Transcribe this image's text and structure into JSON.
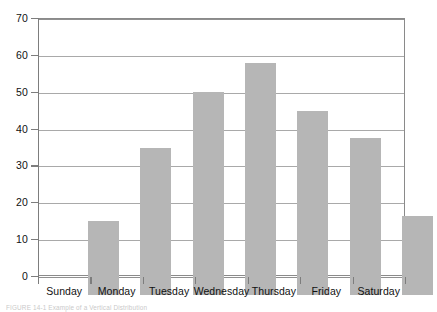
{
  "chart_data": {
    "type": "bar",
    "title": "",
    "subtitle": "",
    "xlabel": "",
    "ylabel": "",
    "categories": [
      "Sunday",
      "Monday",
      "Tuesday",
      "Wednesday",
      "Thursday",
      "Friday",
      "Saturday"
    ],
    "values": [
      20,
      40,
      55,
      63,
      50,
      42.5,
      21.5
    ],
    "ylim": [
      0,
      70
    ],
    "yticks": [
      0,
      10,
      20,
      30,
      40,
      50,
      60,
      70
    ],
    "ytick_labels": [
      "0",
      "10",
      "20",
      "30",
      "40",
      "50",
      "60",
      "70"
    ],
    "grid": true,
    "grid_axis": "y",
    "legend": false,
    "legend_position": "none",
    "bar_color": "#b6b6b6",
    "axis_color": "#7d7d7d",
    "gridline_color": "#9a9a9a",
    "background_color": "#ffffff"
  },
  "caption": {
    "text": "FIGURE 14-1 Example of a Vertical Distribution"
  }
}
